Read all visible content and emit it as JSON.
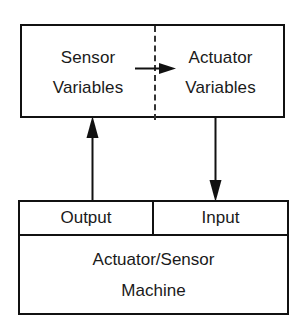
{
  "diagram": {
    "colors": {
      "background": "#ffffff",
      "stroke": "#111111",
      "dashed_stroke": "#333333",
      "text": "#1a1a1a"
    },
    "variables_box": {
      "name": "variables-box",
      "divider_style": "dashed",
      "cells": [
        {
          "name": "sensor-variables-cell",
          "lines": [
            "Sensor",
            "Variables"
          ]
        },
        {
          "name": "actuator-variables-cell",
          "lines": [
            "Actuator",
            "Variables"
          ]
        }
      ]
    },
    "machine_box": {
      "name": "machine-box",
      "ports": [
        {
          "name": "output-port",
          "label": "Output"
        },
        {
          "name": "input-port",
          "label": "Input"
        }
      ],
      "body_lines": [
        "Actuator/Sensor",
        "Machine"
      ]
    },
    "arrows": [
      {
        "name": "sensor-to-actuator-arrow",
        "direction": "right",
        "from": "Sensor Variables",
        "to": "Actuator Variables"
      },
      {
        "name": "output-to-sensor-arrow",
        "direction": "up",
        "from": "Output",
        "to": "Sensor Variables"
      },
      {
        "name": "actuator-to-input-arrow",
        "direction": "down",
        "from": "Actuator Variables",
        "to": "Input"
      }
    ]
  }
}
